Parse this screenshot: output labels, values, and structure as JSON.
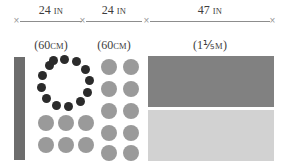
{
  "diagram": {
    "ruler": {
      "tick_glyph": "×",
      "tick_count": 4,
      "segments": [
        {
          "id": "segment-1",
          "imperial_value": "24",
          "imperial_unit": "IN",
          "metric": "(60",
          "metric_unit": "CM",
          "metric_close": ")",
          "metric_full": "(60CM)",
          "inches": 24,
          "centimeters": 60
        },
        {
          "id": "segment-2",
          "imperial_value": "24",
          "imperial_unit": "IN",
          "metric": "(60",
          "metric_unit": "CM",
          "metric_close": ")",
          "metric_full": "(60CM)",
          "inches": 24,
          "centimeters": 60
        },
        {
          "id": "segment-3",
          "imperial_value": "47",
          "imperial_unit": "IN",
          "metric": "(1⅕",
          "metric_unit": "M",
          "metric_close": ")",
          "metric_full": "(1⅕M)",
          "inches": 47,
          "meters": 1.2
        }
      ]
    },
    "sections": [
      {
        "id": "section-1",
        "bar": {
          "label": "vertical-dark-bar",
          "color": "#6d6d6d"
        },
        "ring": {
          "label": "dark-dot-ring",
          "dot_count": 13,
          "color": "#2b2b2b"
        },
        "grid": {
          "label": "gray-dot-grid",
          "columns": 3,
          "rows": 2,
          "color": "#9a9a9a"
        }
      },
      {
        "id": "section-2",
        "grid": {
          "label": "gray-dot-grid",
          "columns": 2,
          "rows": 5,
          "color": "#9a9a9a"
        }
      },
      {
        "id": "section-3",
        "rects": [
          {
            "label": "upper-rectangle",
            "color": "#818181"
          },
          {
            "label": "lower-rectangle",
            "color": "#d2d2d2"
          }
        ]
      }
    ],
    "colors": {
      "line": "#8d8d8d",
      "tick": "#9a9a9a",
      "text": "#3d3d3d",
      "dark_dot": "#2b2b2b",
      "gray_dot": "#9a9a9a",
      "bar": "#6d6d6d",
      "rect_dark": "#818181",
      "rect_light": "#d2d2d2",
      "background": "#ffffff"
    }
  }
}
